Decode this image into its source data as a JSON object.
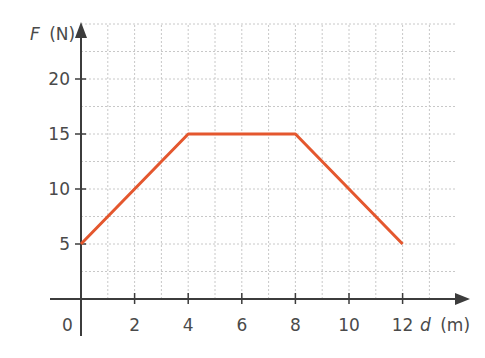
{
  "chart_data": {
    "type": "line",
    "title": "",
    "xlabel": "d (m)",
    "ylabel": "F (N)",
    "xlabel_var": "d",
    "xlabel_unit": "(m)",
    "ylabel_var": "F",
    "ylabel_unit": "(N)",
    "origin_label": "0",
    "x_ticks": [
      2,
      4,
      6,
      8,
      10,
      12
    ],
    "y_ticks": [
      5,
      10,
      15,
      20
    ],
    "xlim": [
      0,
      14
    ],
    "ylim": [
      0,
      24
    ],
    "grid": true,
    "grid_minor_x": 1,
    "grid_minor_y": 2.5,
    "series": [
      {
        "name": "F vs d",
        "color": "#e4572e",
        "x": [
          0,
          4,
          8,
          12
        ],
        "y": [
          5,
          15,
          15,
          5
        ]
      }
    ]
  },
  "colors": {
    "axis": "#3c3c3c",
    "grid": "#c8c8c8",
    "line": "#e4572e"
  }
}
